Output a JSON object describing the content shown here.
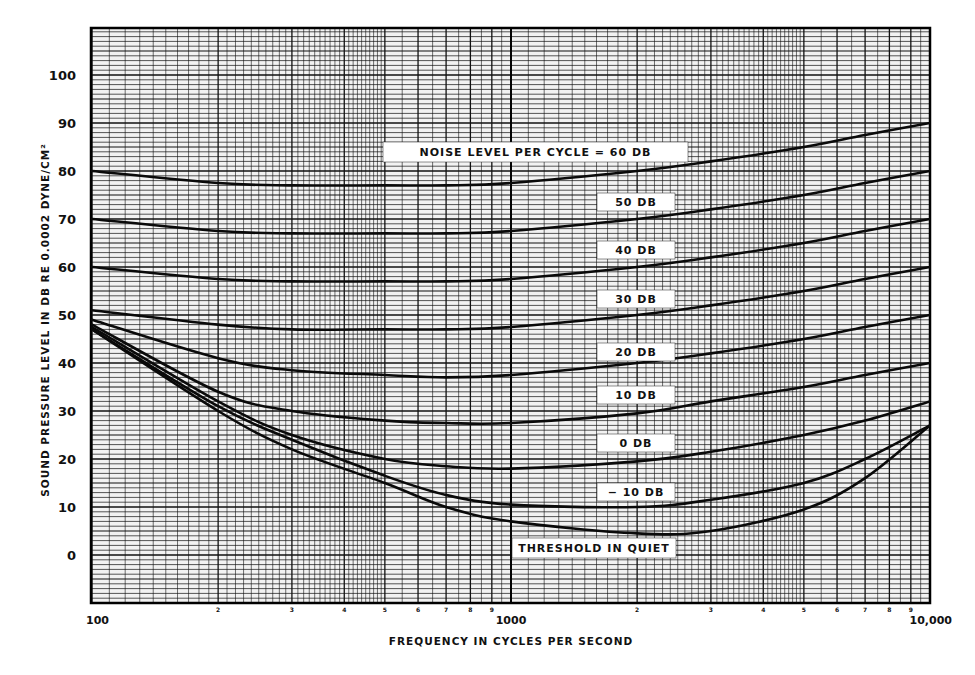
{
  "chart_data": {
    "type": "line",
    "title": "",
    "xlabel": "FREQUENCY IN CYCLES PER SECOND",
    "ylabel": "SOUND PRESSURE LEVEL IN DB RE 0.0002 DYNE/CM²",
    "xscale": "log",
    "xlim": [
      100,
      10000
    ],
    "ylim": [
      -10,
      110
    ],
    "grid": true,
    "x_tick_labels": [
      "100",
      "1000",
      "10,000"
    ],
    "x_minor_tick_labels": [
      "2",
      "3",
      "4",
      "5",
      "6",
      "7",
      "8",
      "9"
    ],
    "y_ticks": [
      0,
      10,
      20,
      30,
      40,
      50,
      60,
      70,
      80,
      90,
      100
    ],
    "x": [
      100,
      200,
      300,
      500,
      700,
      1000,
      2000,
      3000,
      5000,
      7000,
      10000
    ],
    "series": [
      {
        "name": "NOISE LEVEL PER CYCLE = 60 DB",
        "label": "NOISE LEVEL PER CYCLE = 60 DB",
        "values": [
          80,
          77.5,
          77,
          77,
          77,
          77.5,
          80,
          82,
          85,
          87.5,
          90
        ]
      },
      {
        "name": "50 DB",
        "label": "50 DB",
        "values": [
          70,
          67.5,
          67,
          67,
          67,
          67.5,
          70,
          72,
          75,
          77.5,
          80
        ]
      },
      {
        "name": "40 DB",
        "label": "40 DB",
        "values": [
          60,
          57.5,
          57,
          57,
          57,
          57.5,
          60,
          62,
          65,
          67.5,
          70
        ]
      },
      {
        "name": "30 DB",
        "label": "30 DB",
        "values": [
          51,
          48,
          47,
          47,
          47,
          47.5,
          50,
          52,
          55,
          57.5,
          60
        ]
      },
      {
        "name": "20 DB",
        "label": "20 DB",
        "values": [
          49,
          41,
          38.5,
          37.5,
          37,
          37.5,
          40,
          42,
          45,
          47.5,
          50
        ]
      },
      {
        "name": "10 DB",
        "label": "10 DB",
        "values": [
          48,
          34,
          30,
          28,
          27.5,
          27.5,
          29.5,
          32,
          35,
          37.5,
          40
        ]
      },
      {
        "name": "0 DB",
        "label": "0 DB",
        "values": [
          47.5,
          32,
          25,
          20,
          18.5,
          18,
          19.5,
          21.5,
          25,
          28,
          32
        ]
      },
      {
        "name": "-10 DB",
        "label": "− 10 DB",
        "values": [
          47,
          31,
          24,
          16.5,
          12.5,
          10.5,
          10,
          11.5,
          15,
          20,
          27
        ]
      },
      {
        "name": "THRESHOLD IN QUIET",
        "label": "THRESHOLD IN QUIET",
        "values": [
          47,
          30,
          22,
          15,
          10,
          7,
          4.5,
          5,
          9.5,
          16,
          27
        ]
      }
    ]
  }
}
